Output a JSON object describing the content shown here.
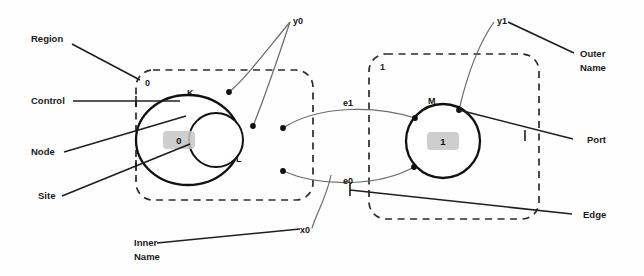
{
  "figure": {
    "background_color": "#fefefe",
    "line_color": "#1f1f1f",
    "link_color": "#6e6e6e",
    "site_fill_color": "#c6c6c6",
    "dash_color": "#2b2b2b"
  },
  "callouts": {
    "region": "Region",
    "control": "Control",
    "node": "Node",
    "site": "Site",
    "inner_name_line1": "Inner",
    "inner_name_line2": "Name",
    "outer_name_line1": "Outer",
    "outer_name_line2": "Name",
    "port": "Port",
    "edge": "Edge"
  },
  "regions": [
    {
      "id": "region-0",
      "label": "0"
    },
    {
      "id": "region-1",
      "label": "1"
    }
  ],
  "nodes": [
    {
      "id": "node-k",
      "control": "K",
      "region": "0"
    },
    {
      "id": "node-l",
      "control": "L",
      "region": "0"
    },
    {
      "id": "node-m",
      "control": "M",
      "region": "1"
    }
  ],
  "sites": [
    {
      "id": "site-0",
      "label": "0",
      "parent": "K"
    },
    {
      "id": "site-1",
      "label": "1",
      "parent": "M"
    }
  ],
  "outer_names": [
    {
      "id": "outer-y0",
      "label": "y0"
    },
    {
      "id": "outer-y1",
      "label": "y1"
    }
  ],
  "inner_names": [
    {
      "id": "inner-x0",
      "label": "x0"
    }
  ],
  "edges": [
    {
      "id": "edge-e0",
      "label": "e0"
    },
    {
      "id": "edge-e1",
      "label": "e1"
    }
  ]
}
